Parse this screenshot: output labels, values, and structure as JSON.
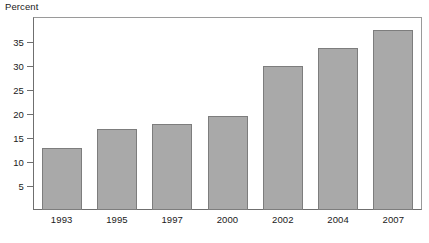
{
  "chart_data": {
    "type": "bar",
    "title": "",
    "subtitle": "",
    "xlabel": "",
    "ylabel": "Percent",
    "categories": [
      "1993",
      "1995",
      "1997",
      "2000",
      "2002",
      "2004",
      "2007"
    ],
    "values": [
      13.0,
      16.9,
      18.0,
      19.6,
      30.1,
      33.8,
      37.5
    ],
    "ylim": [
      0,
      40
    ],
    "yticks": [
      5,
      10,
      15,
      20,
      25,
      30,
      35
    ],
    "ytick_labels": [
      "5",
      "10",
      "15",
      "20",
      "25",
      "30",
      "35"
    ],
    "grid": false,
    "legend": null,
    "bar_color": "#a9a9a9",
    "bar_border_color": "#7d7d7d",
    "axis_color": "#6f6f6f",
    "text_color": "#1a1a1a",
    "background_color": "#ffffff",
    "annotations": []
  }
}
